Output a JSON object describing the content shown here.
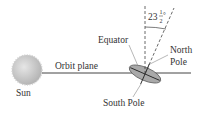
{
  "labels": {
    "sun": "Sun",
    "orbit_plane": "Orbit plane",
    "equator": "Equator",
    "north_pole_line1": "North",
    "north_pole_line2": "Pole",
    "south_pole": "South Pole",
    "tilt_whole": "23",
    "tilt_num": "1",
    "tilt_den": "2",
    "tilt_degree": "°"
  },
  "tilt_angle_degrees": 23.5,
  "colors": {
    "sun": "#c8c8c8",
    "earth": "#a9a9a9",
    "line": "#333333"
  }
}
